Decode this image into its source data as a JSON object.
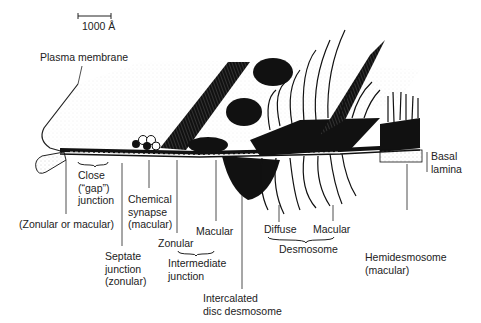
{
  "scale_bar": {
    "label": "1000 Å"
  },
  "labels": {
    "plasma_membrane": "Plasma membrane",
    "close_gap_junction": "Close\n(“gap”)\njunction",
    "zonular_or_macular": "(Zonular or macular)",
    "septate_junction": "Septate\njunction\n(zonular)",
    "chemical_synapse": "Chemical\nsynapse\n(macular)",
    "zonular": "Zonular",
    "macular_intermediate": "Macular",
    "intermediate_junction": "Intermediate\njunction",
    "intercalated_disc_desmosome": "Intercalated\ndisc desmosome",
    "diffuse": "Diffuse",
    "macular_desmosome": "Macular",
    "desmosome": "Desmosome",
    "hemidesmosome": "Hemidesmosome\n(macular)",
    "basal_lamina": "Basal\nlamina"
  },
  "colors": {
    "ink": "#111111",
    "paper": "#ffffff",
    "stipple": "#8a8a8a"
  }
}
